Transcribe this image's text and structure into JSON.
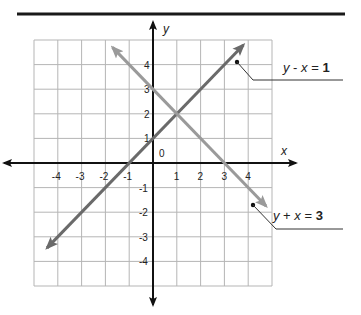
{
  "chart_data": {
    "type": "line",
    "title": "",
    "xlabel": "x",
    "ylabel": "y",
    "xlim": [
      -5,
      5
    ],
    "ylim": [
      -5,
      5
    ],
    "grid": true,
    "origin_label": "0",
    "x_ticks": [
      -4,
      -3,
      -2,
      -1,
      1,
      2,
      3,
      4
    ],
    "x_tick_labels": [
      "-4",
      "-3",
      "-2",
      "-1",
      "1",
      "2",
      "3",
      "4"
    ],
    "y_ticks": [
      4,
      3,
      2,
      1,
      -1,
      -2,
      -3,
      -4
    ],
    "y_tick_labels": [
      "4",
      "3",
      "2",
      "1",
      "-1",
      "-2",
      "-3",
      "-4"
    ],
    "series": [
      {
        "name": "y - x = 1",
        "label_parts": [
          "y",
          " - ",
          "x",
          " = ",
          "1"
        ],
        "color": "#6a6a6a",
        "x": [
          -4.45,
          3.8
        ],
        "y": [
          -3.45,
          4.8
        ],
        "arrows": "both"
      },
      {
        "name": "y + x = 3",
        "label_parts": [
          "y",
          " + ",
          "x",
          " = ",
          "3"
        ],
        "color": "#9a9a9a",
        "x": [
          -1.7,
          4.75
        ],
        "y": [
          4.7,
          -1.75
        ],
        "arrows": "both"
      }
    ],
    "intersection": {
      "x": 1,
      "y": 2
    },
    "legend_position": "right, callout labels"
  }
}
